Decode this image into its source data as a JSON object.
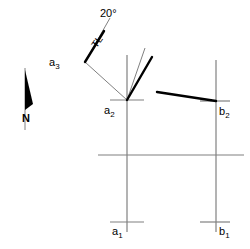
{
  "diagram": {
    "background_color": "#ffffff",
    "stroke_thin_color": "#808080",
    "stroke_thick_color": "#000000",
    "labels": {
      "angle": "20°",
      "true_length": "TL",
      "north": "N",
      "a1_base": "a",
      "a1_sub": "1",
      "a2_base": "a",
      "a2_sub": "2",
      "a3_base": "a",
      "a3_sub": "3",
      "b1_base": "b",
      "b1_sub": "1",
      "b2_base": "b",
      "b2_sub": "2"
    },
    "points": {
      "a3": {
        "x": 85,
        "y": 62
      },
      "a2": {
        "x": 127,
        "y": 100
      },
      "b2": {
        "x": 216,
        "y": 101
      },
      "a1": {
        "x": 127,
        "y": 222
      },
      "b1": {
        "x": 216,
        "y": 222
      }
    },
    "measurements": {
      "angle_value": 20,
      "angle_unit": "degrees"
    }
  }
}
